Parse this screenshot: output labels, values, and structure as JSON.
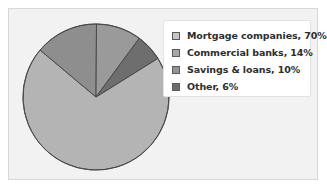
{
  "chart_data": {
    "type": "pie",
    "title": "",
    "categories": [
      "Mortgage companies",
      "Commercial banks",
      "Savings & loans",
      "Other"
    ],
    "values": [
      70,
      14,
      10,
      6
    ],
    "unit": "%",
    "legend_position": "right",
    "grid": false,
    "start_angle_deg": -32,
    "direction": "clockwise",
    "slice_colors": [
      "#b4b4b4",
      "#8e8e8e",
      "#9a9a9a",
      "#6e6e6e"
    ],
    "outline_color": "#4a4a4a",
    "legend_entries": [
      {
        "label": "Mortgage companies, 70%",
        "swatch_color": "#c6c6c6",
        "value": 70,
        "name": "Mortgage companies"
      },
      {
        "label": "Commercial banks, 14%",
        "swatch_color": "#a8a8a8",
        "value": 14,
        "name": "Commercial banks"
      },
      {
        "label": "Savings & loans, 10%",
        "swatch_color": "#949494",
        "value": 10,
        "name": "Savings & loans"
      },
      {
        "label": "Other, 6%",
        "swatch_color": "#6e6e6e",
        "value": 6,
        "name": "Other"
      }
    ]
  },
  "figure": {
    "background_color": "#ffffff",
    "plot_background_color": "#f2f2f2",
    "plot_border_color": "#d8d8d8",
    "legend_background_color": "#ffffff",
    "legend_border_color": "#e2e2e2"
  },
  "pie": {
    "center_x": 96,
    "center_y": 97,
    "radius": 73
  }
}
